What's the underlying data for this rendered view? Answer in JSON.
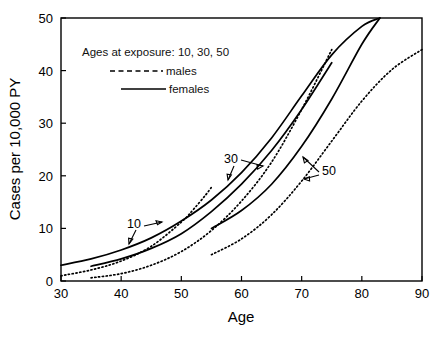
{
  "chart_data": {
    "type": "line",
    "title": "",
    "xlabel": "Age",
    "ylabel": "Cases per 10,000 PY",
    "xlim": [
      30,
      90
    ],
    "ylim": [
      0,
      50
    ],
    "xticks": [
      30,
      40,
      50,
      60,
      70,
      80,
      90
    ],
    "yticks": [
      0,
      10,
      20,
      30,
      40,
      50
    ],
    "grid": false,
    "legend_position": "upper-left-inside",
    "legend_title": "Ages at exposure:  10, 30, 50",
    "legend_entries": [
      {
        "label": "males",
        "style": "dashed"
      },
      {
        "label": "females",
        "style": "solid"
      }
    ],
    "annotations": [
      {
        "text": "10",
        "x": 44,
        "y": 13.5
      },
      {
        "text": "30",
        "x": 59.5,
        "y": 22.5
      },
      {
        "text": "50",
        "x": 73.5,
        "y": 20.5
      }
    ],
    "series": [
      {
        "name": "males, age at exposure 10",
        "sex": "males",
        "age_at_exposure": 10,
        "style": "dotted",
        "x": [
          30,
          35,
          40,
          45,
          50,
          52,
          54,
          55
        ],
        "y": [
          1.0,
          2.1,
          3.8,
          6.6,
          11.2,
          13.6,
          16.3,
          17.8
        ]
      },
      {
        "name": "females, age at exposure 10",
        "sex": "females",
        "age_at_exposure": 10,
        "style": "solid",
        "x": [
          30,
          35,
          40,
          45,
          50,
          55,
          60,
          65,
          70,
          75,
          80,
          83
        ],
        "y": [
          3.0,
          4.2,
          5.9,
          8.2,
          11.4,
          15.4,
          20.6,
          27.2,
          35.2,
          43.0,
          48.4,
          50.0
        ]
      },
      {
        "name": "males, age at exposure 30",
        "sex": "males",
        "age_at_exposure": 30,
        "style": "dotted",
        "x": [
          35,
          40,
          45,
          50,
          55,
          60,
          65,
          70,
          75
        ],
        "y": [
          0.6,
          1.4,
          3.0,
          5.6,
          9.6,
          15.2,
          22.6,
          32.6,
          44.0
        ]
      },
      {
        "name": "females, age at exposure 30",
        "sex": "females",
        "age_at_exposure": 30,
        "style": "solid",
        "x": [
          35,
          40,
          45,
          50,
          55,
          60,
          65,
          70,
          75
        ],
        "y": [
          2.8,
          4.2,
          6.2,
          9.0,
          13.2,
          18.4,
          24.8,
          32.6,
          41.5
        ]
      },
      {
        "name": "males, age at exposure 50",
        "sex": "males",
        "age_at_exposure": 50,
        "style": "dotted",
        "x": [
          55,
          60,
          65,
          70,
          75,
          80,
          85,
          90
        ],
        "y": [
          5.0,
          8.0,
          12.6,
          19.0,
          26.6,
          34.2,
          40.2,
          44.0
        ]
      },
      {
        "name": "females, age at exposure 50",
        "sex": "females",
        "age_at_exposure": 50,
        "style": "solid",
        "x": [
          55,
          60,
          65,
          70,
          75,
          80,
          83
        ],
        "y": [
          10.0,
          13.4,
          18.4,
          25.6,
          34.6,
          45.0,
          50.0
        ]
      }
    ]
  }
}
